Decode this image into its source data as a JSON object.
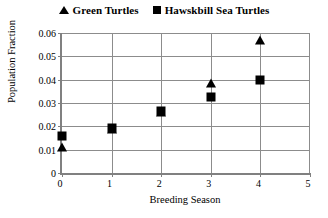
{
  "legend": {
    "entries": [
      {
        "label": "Green Turtles",
        "marker": "triangle-marker",
        "color": "#000000"
      },
      {
        "label": "Hawskbill Sea Turtles",
        "marker": "square-marker",
        "color": "#000000"
      }
    ]
  },
  "chart_data": {
    "type": "scatter",
    "title": "",
    "xlabel": "Breeding Season",
    "ylabel": "Population Fraction",
    "xlim": [
      0,
      5
    ],
    "ylim": [
      0,
      0.06
    ],
    "xticks": [
      "0",
      "1",
      "2",
      "3",
      "4",
      "5"
    ],
    "yticks": [
      "0",
      "0.01",
      "0.02",
      "0.03",
      "0.04",
      "0.05",
      "0.06"
    ],
    "xtick_values": [
      0,
      1,
      2,
      3,
      4,
      5
    ],
    "ytick_values": [
      0,
      0.01,
      0.02,
      0.03,
      0.04,
      0.05,
      0.06
    ],
    "grid": "horizontal-and-vertical",
    "legend_position": "top-center",
    "x": [
      0,
      1,
      2,
      3,
      4
    ],
    "series": [
      {
        "name": "Green Turtles",
        "marker": "triangle",
        "color": "#000000",
        "values": [
          0.011,
          0.019,
          0.026,
          0.0385,
          0.057
        ]
      },
      {
        "name": "Hawskbill Sea Turtles",
        "marker": "square",
        "color": "#000000",
        "values": [
          0.016,
          0.0195,
          0.0265,
          0.0325,
          0.04
        ]
      }
    ]
  },
  "colors": {
    "grid": "#8c8c8c",
    "axis": "#808080",
    "marker": "#000000",
    "background": "#ffffff"
  }
}
